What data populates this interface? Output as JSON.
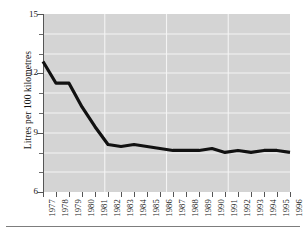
{
  "chart_data": {
    "type": "line",
    "title": "",
    "xlabel": "",
    "ylabel": "Litres per 100 kilometres",
    "categories": [
      "1977",
      "1978",
      "1979",
      "1980",
      "1981",
      "1982",
      "1983",
      "1984",
      "1985",
      "1986",
      "1987",
      "1988",
      "1989",
      "1990",
      "1991",
      "1992",
      "1993",
      "1994",
      "1995",
      "1996"
    ],
    "values": [
      12.6,
      11.5,
      11.5,
      10.3,
      9.3,
      8.4,
      8.3,
      8.4,
      8.3,
      8.2,
      8.1,
      8.1,
      8.1,
      8.2,
      8.0,
      8.1,
      8.0,
      8.1,
      8.1,
      8.0
    ],
    "series": [
      {
        "name": "Litres per 100 kilometres",
        "values": [
          12.6,
          11.5,
          11.5,
          10.3,
          9.3,
          8.4,
          8.3,
          8.4,
          8.3,
          8.2,
          8.1,
          8.1,
          8.1,
          8.2,
          8.0,
          8.1,
          8.0,
          8.1,
          8.1,
          8.0
        ]
      }
    ],
    "ylim": [
      6,
      15
    ],
    "yticks": [
      "6",
      "9",
      "12",
      "15"
    ],
    "ytick_values": [
      6,
      9,
      12,
      15
    ],
    "yminor_values": [
      7,
      8,
      10,
      11,
      13,
      14
    ],
    "grid": true,
    "grid_color": "#f2f2f2",
    "plot_background": "#d4d4d4",
    "line_color": "#111111",
    "legend": "none"
  },
  "axis": {
    "y_title": "Litres per 100 kilometres"
  }
}
